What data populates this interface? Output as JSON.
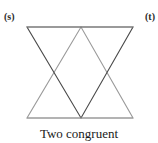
{
  "figure": {
    "caption": "Two congruent",
    "background_color": "#ffffff",
    "width": 158,
    "height": 143,
    "labels": [
      {
        "id": "s",
        "text": "(s)",
        "position": "top-left",
        "color": "#2b2b2b"
      },
      {
        "id": "t",
        "text": "(t)",
        "position": "top-right",
        "color": "#2b2b2b"
      }
    ],
    "shapes": [
      {
        "name": "triangle-s-down-pointing",
        "orientation": "down",
        "stroke_color": "#4a4a4a",
        "stroke_width": 1.1,
        "fill": "none",
        "points": "27,27 133,27 81,118"
      },
      {
        "name": "triangle-t-up-pointing",
        "orientation": "up",
        "stroke_color": "#9a9a9a",
        "stroke_width": 1.1,
        "fill": "none",
        "points": "27,118 133,118 81,27"
      }
    ],
    "top_edge": {
      "name": "top-edge-line",
      "stroke_color": "#8f8f8f",
      "x1": 27,
      "y1": 27,
      "x2": 133,
      "y2": 27
    },
    "bottom_edge": {
      "name": "bottom-edge-line",
      "stroke_color": "#9a9a9a",
      "x1": 27,
      "y1": 118,
      "x2": 133,
      "y2": 118
    }
  }
}
